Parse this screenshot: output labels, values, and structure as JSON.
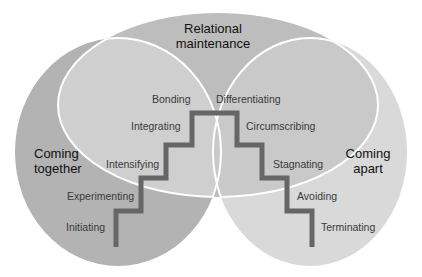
{
  "diagram": {
    "phases": {
      "top": {
        "line1": "Relational",
        "line2": "maintenance"
      },
      "left": {
        "line1": "Coming",
        "line2": "together"
      },
      "right": {
        "line1": "Coming",
        "line2": "apart"
      }
    },
    "stages_up": [
      "Initiating",
      "Experimenting",
      "Intensifying",
      "Integrating",
      "Bonding"
    ],
    "stages_down": [
      "Differentiating",
      "Circumscribing",
      "Stagnating",
      "Avoiding",
      "Terminating"
    ],
    "colors": {
      "left_circle": "#b3b3b3",
      "right_circle": "#d9d9d9",
      "top_ellipse": "#bdbdbd",
      "overlap_left_top": "#cfcfcf",
      "overlap_right_top": "#c9c9c9",
      "staircase": "#666666",
      "outline": "#ffffff"
    }
  }
}
